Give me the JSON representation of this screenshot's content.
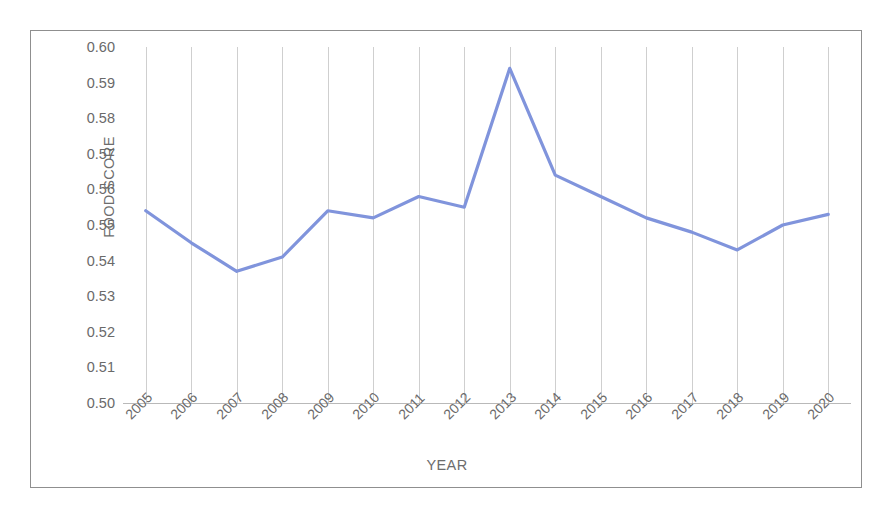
{
  "chart_data": {
    "type": "line",
    "title": "",
    "xlabel": "YEAR",
    "ylabel": "FOOD SCORE",
    "categories": [
      "2005",
      "2006",
      "2007",
      "2008",
      "2009",
      "2010",
      "2011",
      "2012",
      "2013",
      "2014",
      "2015",
      "2016",
      "2017",
      "2018",
      "2019",
      "2020"
    ],
    "values": [
      0.554,
      0.545,
      0.537,
      0.541,
      0.554,
      0.552,
      0.558,
      0.555,
      0.594,
      0.564,
      0.558,
      0.552,
      0.548,
      0.543,
      0.55,
      0.553
    ],
    "series": [
      {
        "name": "Food Score",
        "values": [
          0.554,
          0.545,
          0.537,
          0.541,
          0.554,
          0.552,
          0.558,
          0.555,
          0.594,
          0.564,
          0.558,
          0.552,
          0.548,
          0.543,
          0.55,
          0.553
        ]
      }
    ],
    "ylim": [
      0.5,
      0.6
    ],
    "y_ticks": [
      "0.60",
      "0.59",
      "0.58",
      "0.57",
      "0.56",
      "0.55",
      "0.54",
      "0.53",
      "0.52",
      "0.51",
      "0.50"
    ],
    "y_tick_values": [
      0.6,
      0.59,
      0.58,
      0.57,
      0.56,
      0.55,
      0.54,
      0.53,
      0.52,
      0.51,
      0.5
    ],
    "grid": "vertical",
    "legend": "none",
    "line_color": "#8094dc",
    "grid_color": "#cfcfcf",
    "axis_color": "#b9b9b9",
    "text_color": "#6a6a6a",
    "border_color": "#8f8f8f",
    "background": "#ffffff"
  }
}
